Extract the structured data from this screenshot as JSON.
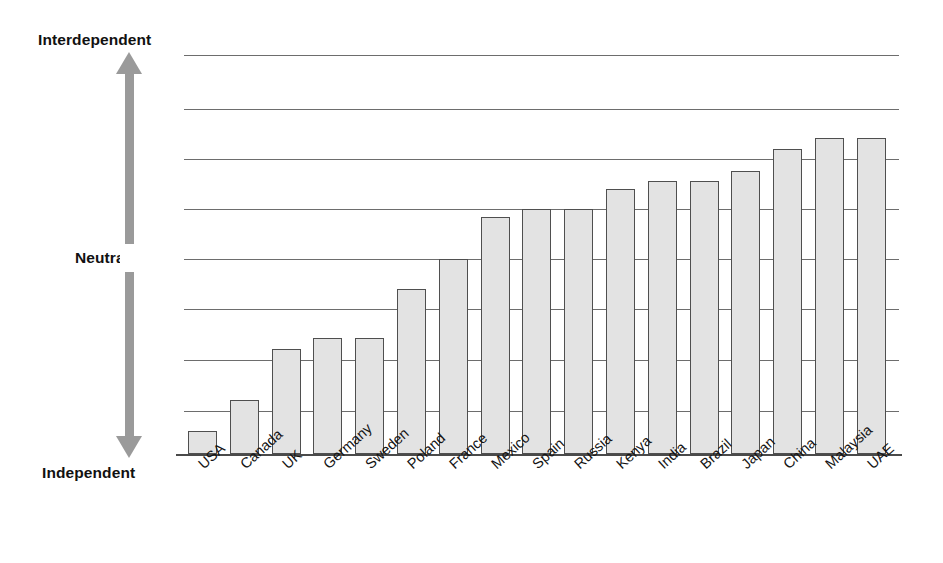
{
  "chart_data": {
    "type": "bar",
    "title": "",
    "subtitle": "",
    "xlabel": "",
    "ylabel": "",
    "grid": true,
    "legend": null,
    "y_axis": {
      "type": "ordinal-scale",
      "top_label": "Interdependent",
      "middle_label": "Neutral",
      "bottom_label": "Independent",
      "axis_marker": "double-headed-vertical-arrow",
      "tick_labels": [],
      "gridline_count": 8
    },
    "categories": [
      "USA",
      "Canada",
      "UK",
      "Germany",
      "Sweden",
      "Poland",
      "France",
      "Mexico",
      "Spain",
      "Russia",
      "Kenya",
      "India",
      "Brazil",
      "Japan",
      "China",
      "Malaysia",
      "UAE"
    ],
    "values": [
      0.06,
      0.135,
      0.26,
      0.285,
      0.285,
      0.41,
      0.48,
      0.585,
      0.6,
      0.6,
      0.655,
      0.675,
      0.675,
      0.7,
      0.75,
      0.775,
      0.775
    ],
    "value_note": "fraction of the Independent-to-Interdependent axis span",
    "ylim": [
      0,
      1
    ],
    "bar_fill_color": "#e3e3e3",
    "bar_border_color": "#4f4f4f",
    "gridline_color": "#6d6d6d",
    "arrow_color": "#9a9a9a",
    "background_color": "#ffffff"
  },
  "geometry": {
    "plot_left": 184,
    "plot_top": 48,
    "plot_width": 715,
    "baseline_y": 454,
    "bar_width": 29,
    "bar_pitch": 41.8,
    "gridlines_y": [
      55,
      109,
      159,
      209,
      259,
      309,
      360,
      411
    ],
    "bar_tops_y": [
      431,
      400,
      349,
      338,
      338,
      289,
      259,
      217,
      209,
      209,
      189,
      181,
      181,
      171,
      149,
      138,
      138
    ]
  }
}
